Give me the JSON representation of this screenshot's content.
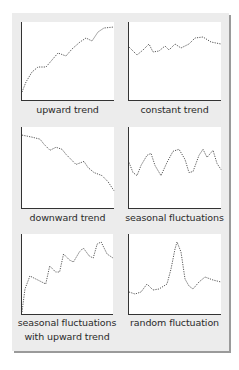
{
  "figure": {
    "panels": [
      {
        "label": "upward trend",
        "points": "0,70 4,60 10,50 16,45 24,45 30,38 36,31 44,34 50,27 58,20 64,16 70,19 76,10 82,6 92,5"
      },
      {
        "label": "constant trend",
        "points": "0,25 8,33 14,28 20,22 24,30 30,29 36,24 40,28 46,22 52,26 60,22 66,16 74,15 82,20 92,22"
      },
      {
        "label": "downward trend",
        "points": "0,8 10,10 18,12 22,17 28,23 34,20 40,22 44,27 48,31 54,37 62,34 66,40 72,45 80,48 86,54 92,63"
      },
      {
        "label": "seasonal fluctuations",
        "points": "0,35 4,45 8,48 12,38 18,28 22,26 26,38 32,48 38,35 44,24 50,22 56,32 60,45 64,44 70,28 74,22 78,30 84,23 88,36 92,42"
      },
      {
        "label": "seasonal fluctuations\nwith upward trend",
        "label_lines": [
          "seasonal fluctuations",
          "with upward trend"
        ],
        "points": "0,78 3,55 8,42 14,45 20,48 24,50 28,32 34,38 38,38 42,20 48,26 52,28 58,18 62,14 68,22 72,24 76,10 80,8 86,20 92,24"
      },
      {
        "label": "random fluctuation",
        "points": "0,58 6,60 12,58 18,50 24,56 30,55 38,50 42,35 46,15 48,8 52,18 56,45 60,52 64,55 70,48 76,43 84,46 92,48"
      }
    ],
    "colors": {
      "panel_bg": "#ececec",
      "plot_bg": "#ffffff",
      "axis": "#333333",
      "line": "#444444",
      "shadow": "#9a9a9a"
    }
  }
}
